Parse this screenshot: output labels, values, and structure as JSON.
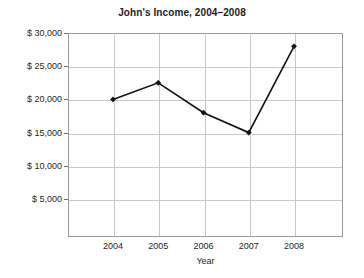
{
  "chart_data": {
    "type": "line",
    "title": "John's Income, 2004–2008",
    "xlabel": "Year",
    "ylabel": "",
    "categories": [
      "2004",
      "2005",
      "2006",
      "2007",
      "2008"
    ],
    "x": [
      2004,
      2005,
      2006,
      2007,
      2008
    ],
    "values": [
      20000,
      22500,
      18000,
      15000,
      28000
    ],
    "series": [
      {
        "name": "Income",
        "values": [
          20000,
          22500,
          18000,
          15000,
          28000
        ]
      }
    ],
    "ylim": [
      0,
      30000
    ],
    "y_tick_values": [
      30000,
      25000,
      20000,
      15000,
      10000,
      5000
    ],
    "y_tick_labels": [
      "$ 30,000",
      "$ 25,000",
      "$ 20,000",
      "$ 15,000",
      "$ 10,000",
      "$ 5,000"
    ],
    "x_tick_labels": [
      "2004",
      "2005",
      "2006",
      "2007",
      "2008"
    ],
    "grid": true,
    "legend": false,
    "legend_position": "none",
    "marker": "diamond",
    "line_color": "#121212",
    "grid_color": "#c8c8c8",
    "frame_color": "#9a9a9a",
    "background_color": "#ffffff",
    "annotations": []
  },
  "figure": {
    "title": "John's Income, 2004–2008",
    "x_axis_title": "Year"
  },
  "y_axis": {
    "ticks": [
      {
        "label": "$ 30,000",
        "value": 30000
      },
      {
        "label": "$ 25,000",
        "value": 25000
      },
      {
        "label": "$ 20,000",
        "value": 20000
      },
      {
        "label": "$ 15,000",
        "value": 15000
      },
      {
        "label": "$ 10,000",
        "value": 10000
      },
      {
        "label": "$ 5,000",
        "value": 5000
      }
    ]
  },
  "x_axis": {
    "title": "Year",
    "ticks": [
      {
        "label": "2004",
        "value": 2004
      },
      {
        "label": "2005",
        "value": 2005
      },
      {
        "label": "2006",
        "value": 2006
      },
      {
        "label": "2007",
        "value": 2007
      },
      {
        "label": "2008",
        "value": 2008
      }
    ]
  }
}
